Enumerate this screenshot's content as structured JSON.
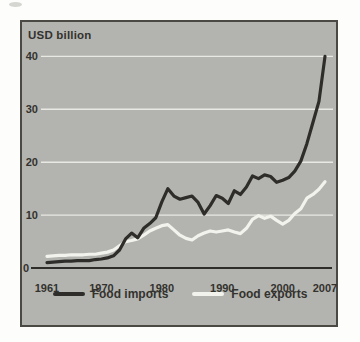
{
  "figure": {
    "axis_unit_label": "USD billion"
  },
  "chart_data": {
    "type": "line",
    "title": "",
    "xlabel": "",
    "ylabel": "USD billion",
    "xlim": [
      1961,
      2007
    ],
    "ylim": [
      0,
      40
    ],
    "xticks": [
      1961,
      1970,
      1980,
      1990,
      2000,
      2007
    ],
    "yticks": [
      0,
      10,
      20,
      30,
      40
    ],
    "grid": "horizontal white gridlines on gray panel",
    "legend_position": "bottom",
    "panel_background": "#b3b4b0",
    "gridline_color": "#e9e9e3",
    "axis_line_color": "#2f2d29",
    "text_color": "#33322e",
    "x": [
      1961,
      1962,
      1963,
      1964,
      1965,
      1966,
      1967,
      1968,
      1969,
      1970,
      1971,
      1972,
      1973,
      1974,
      1975,
      1976,
      1977,
      1978,
      1979,
      1980,
      1981,
      1982,
      1983,
      1984,
      1985,
      1986,
      1987,
      1988,
      1989,
      1990,
      1991,
      1992,
      1993,
      1994,
      1995,
      1996,
      1997,
      1998,
      1999,
      2000,
      2001,
      2002,
      2003,
      2004,
      2005,
      2006,
      2007
    ],
    "series": [
      {
        "name": "Food imports",
        "color": "#2f2d29",
        "values": [
          1.0,
          1.1,
          1.2,
          1.3,
          1.3,
          1.4,
          1.4,
          1.4,
          1.6,
          1.7,
          1.9,
          2.3,
          3.4,
          5.5,
          6.6,
          5.7,
          7.5,
          8.4,
          9.5,
          12.5,
          15.0,
          13.6,
          13.0,
          13.3,
          13.6,
          12.4,
          10.2,
          11.8,
          13.7,
          13.2,
          12.2,
          14.6,
          13.9,
          15.3,
          17.4,
          16.9,
          17.6,
          17.3,
          16.2,
          16.6,
          17.1,
          18.3,
          20.2,
          23.5,
          27.5,
          31.5,
          40.0
        ]
      },
      {
        "name": "Food exports",
        "color": "#f3f3ed",
        "values": [
          2.2,
          2.3,
          2.4,
          2.4,
          2.5,
          2.5,
          2.5,
          2.6,
          2.6,
          2.8,
          3.0,
          3.4,
          4.2,
          5.0,
          5.2,
          5.5,
          6.2,
          7.0,
          7.5,
          8.0,
          8.2,
          7.2,
          6.2,
          5.6,
          5.3,
          6.1,
          6.6,
          7.0,
          6.8,
          7.0,
          7.2,
          6.8,
          6.5,
          7.5,
          9.2,
          9.9,
          9.4,
          9.8,
          9.0,
          8.3,
          9.0,
          10.3,
          11.2,
          13.2,
          13.9,
          14.9,
          16.3
        ]
      }
    ]
  }
}
